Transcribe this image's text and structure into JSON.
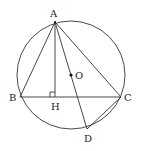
{
  "diagram": {
    "type": "geometry",
    "circle": {
      "center": "O",
      "cx": 71,
      "cy": 75,
      "r": 54
    },
    "points": {
      "A": {
        "x": 55,
        "y": 22,
        "label": "A",
        "lx": 50,
        "ly": 17
      },
      "B": {
        "x": 20,
        "y": 97,
        "label": "B",
        "lx": 9,
        "ly": 101
      },
      "C": {
        "x": 121,
        "y": 97,
        "label": "C",
        "lx": 124,
        "ly": 101
      },
      "H": {
        "x": 55,
        "y": 97,
        "label": "H",
        "lx": 51,
        "ly": 110
      },
      "O": {
        "x": 71,
        "y": 75,
        "label": "O",
        "lx": 75,
        "ly": 79
      },
      "D": {
        "x": 87,
        "y": 129,
        "label": "D",
        "lx": 84,
        "ly": 142
      }
    },
    "segments": [
      "AB",
      "AC",
      "BC",
      "AH",
      "AD",
      "CD"
    ],
    "right_angle_mark": "H"
  }
}
